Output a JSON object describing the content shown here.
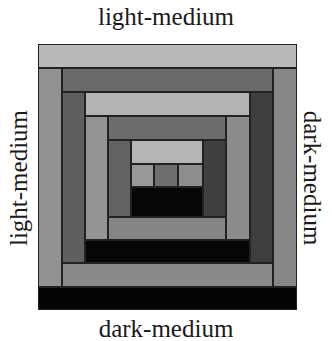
{
  "labels": {
    "top": "light-medium",
    "left": "light-medium",
    "right": "dark-medium",
    "bottom": "dark-medium"
  },
  "colors": {
    "light": "#b9b9b9",
    "light_medium": "#959595",
    "medium": "#7d7d7d",
    "dark_medium": "#5e5e5e",
    "dark": "#4a4a4a",
    "black": "#050505"
  },
  "quilt": {
    "description": "log cabin quilt block",
    "strips": [
      {
        "name": "ring1-top",
        "x": 0,
        "y": 0,
        "w": 259,
        "h": 24,
        "color": "#b9b9b9"
      },
      {
        "name": "ring1-left",
        "x": 0,
        "y": 24,
        "w": 24,
        "h": 219,
        "color": "#929292"
      },
      {
        "name": "ring1-right",
        "x": 235,
        "y": 24,
        "w": 24,
        "h": 219,
        "color": "#878787"
      },
      {
        "name": "ring1-bottom",
        "x": 0,
        "y": 243,
        "w": 259,
        "h": 23,
        "color": "#050505"
      },
      {
        "name": "ring2-top",
        "x": 24,
        "y": 24,
        "w": 211,
        "h": 24,
        "color": "#6a6a6a"
      },
      {
        "name": "ring2-left",
        "x": 24,
        "y": 48,
        "w": 23,
        "h": 171,
        "color": "#5f5f5f"
      },
      {
        "name": "ring2-right",
        "x": 212,
        "y": 48,
        "w": 23,
        "h": 171,
        "color": "#3e3e3e"
      },
      {
        "name": "ring2-bottom",
        "x": 24,
        "y": 219,
        "w": 211,
        "h": 24,
        "color": "#8a8a8a"
      },
      {
        "name": "ring3-top",
        "x": 47,
        "y": 48,
        "w": 165,
        "h": 24,
        "color": "#b3b3b3"
      },
      {
        "name": "ring3-left",
        "x": 47,
        "y": 72,
        "w": 23,
        "h": 124,
        "color": "#949494"
      },
      {
        "name": "ring3-right",
        "x": 188,
        "y": 72,
        "w": 24,
        "h": 124,
        "color": "#8c8c8c"
      },
      {
        "name": "ring3-bottom",
        "x": 47,
        "y": 196,
        "w": 165,
        "h": 23,
        "color": "#060606"
      },
      {
        "name": "ring4-top",
        "x": 70,
        "y": 72,
        "w": 118,
        "h": 24,
        "color": "#6c6c6c"
      },
      {
        "name": "ring4-left",
        "x": 70,
        "y": 96,
        "w": 23,
        "h": 77,
        "color": "#626262"
      },
      {
        "name": "ring4-right",
        "x": 165,
        "y": 96,
        "w": 23,
        "h": 77,
        "color": "#404040"
      },
      {
        "name": "ring4-bottom",
        "x": 70,
        "y": 173,
        "w": 118,
        "h": 23,
        "color": "#858585"
      },
      {
        "name": "ring5-top",
        "x": 93,
        "y": 96,
        "w": 72,
        "h": 24,
        "color": "#b5b5b5"
      },
      {
        "name": "ring5-left",
        "x": 93,
        "y": 120,
        "w": 23,
        "h": 23,
        "color": "#989898"
      },
      {
        "name": "ring5-center",
        "x": 116,
        "y": 120,
        "w": 24,
        "h": 23,
        "color": "#6e6e6e"
      },
      {
        "name": "ring5-right",
        "x": 140,
        "y": 120,
        "w": 25,
        "h": 23,
        "color": "#8e8e8e"
      },
      {
        "name": "ring5-bottom",
        "x": 93,
        "y": 143,
        "w": 72,
        "h": 30,
        "color": "#070707"
      }
    ]
  }
}
